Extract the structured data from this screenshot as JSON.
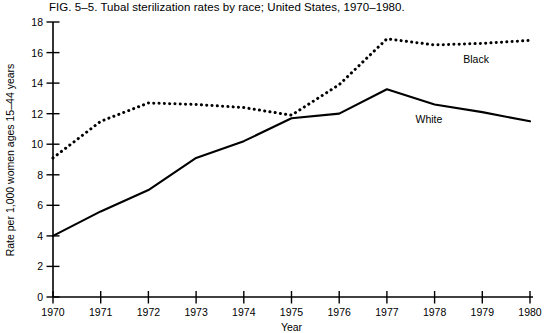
{
  "figure": {
    "caption": "FIG. 5–5.    Tubal sterilization rates by race; United States, 1970–1980.",
    "ink_color": "#000000",
    "background_color": "#ffffff"
  },
  "chart_data": {
    "type": "line",
    "title": "FIG. 5–5.    Tubal sterilization rates by race; United States, 1970–1980.",
    "xlabel": "Year",
    "ylabel": "Rate per 1,000 women ages 15–44 years",
    "x": [
      1970,
      1971,
      1972,
      1973,
      1974,
      1975,
      1976,
      1977,
      1978,
      1979,
      1980
    ],
    "xtick_labels": [
      "1970",
      "1971",
      "1972",
      "1973",
      "1974",
      "1975",
      "1976",
      "1977",
      "1978",
      "1979",
      "1980"
    ],
    "ytick_labels": [
      "0",
      "2",
      "4",
      "6",
      "8",
      "10",
      "12",
      "14",
      "16",
      "18"
    ],
    "yticks": [
      0,
      2,
      4,
      6,
      8,
      10,
      12,
      14,
      16,
      18
    ],
    "xlim": [
      1970,
      1980
    ],
    "ylim": [
      0,
      18
    ],
    "grid": false,
    "legend_position": "inline-annotations",
    "series": [
      {
        "name": "Black",
        "style": "dotted",
        "label_text": "Black",
        "values": [
          9.1,
          11.5,
          12.7,
          12.6,
          12.4,
          11.9,
          13.9,
          16.9,
          16.5,
          16.6,
          16.8
        ]
      },
      {
        "name": "White",
        "style": "solid",
        "label_text": "White",
        "values": [
          4.0,
          5.6,
          7.0,
          9.1,
          10.2,
          11.7,
          12.0,
          13.6,
          12.6,
          12.1,
          11.5
        ]
      }
    ],
    "annotations": [
      {
        "text": "Black",
        "x": 1978.6,
        "y": 15.3
      },
      {
        "text": "White",
        "x": 1977.6,
        "y": 11.4
      }
    ]
  }
}
